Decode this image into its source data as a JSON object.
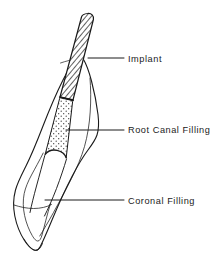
{
  "figure": {
    "name": "endodontically-treated-tooth-diagram",
    "type": "line-diagram",
    "background_color": "#ffffff",
    "line_color": "#1a1a1a",
    "width": 216,
    "height": 274
  },
  "labels": [
    {
      "id": "implant",
      "text": "Implant",
      "text_x": 128,
      "text_y": 62,
      "leader_x1": 88,
      "leader_x2": 124,
      "leader_y": 58
    },
    {
      "id": "root-canal-filling",
      "text": "Root Canal Filling",
      "text_x": 128,
      "text_y": 133,
      "leader_x1": 66,
      "leader_x2": 124,
      "leader_y": 130
    },
    {
      "id": "coronal-filling",
      "text": "Coronal Filling",
      "text_x": 128,
      "text_y": 204,
      "leader_x1": 45,
      "leader_x2": 124,
      "leader_y": 200
    }
  ],
  "regions": [
    {
      "id": "implant-post",
      "label": "Implant",
      "fill_pattern": "diagonal-hatch",
      "description": "Narrow hatched post extending from above the root apex down into the coronal third of the canal"
    },
    {
      "id": "root-canal-filling",
      "label": "Root Canal Filling",
      "fill_pattern": "stipple-dots",
      "description": "Dotted sealer and gutta-percha filling the canal below the implant post"
    },
    {
      "id": "coronal-filling",
      "label": "Coronal Filling",
      "fill_pattern": "none",
      "description": "Unfilled outline region of the crown below the curved pulp chamber roof"
    },
    {
      "id": "tooth-outline",
      "label": "Tooth",
      "fill_pattern": "none",
      "description": "Outer contour of the tooth root and crown"
    }
  ],
  "colors": {
    "ink": "#1a1a1a",
    "hatch": "#2b2b2b",
    "stipple": "#333333",
    "paper": "#ffffff"
  }
}
